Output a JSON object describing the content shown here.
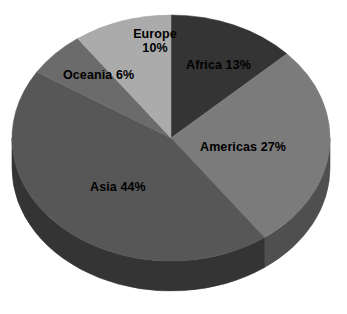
{
  "chart_data": {
    "type": "pie",
    "title": "",
    "subtitle": "",
    "xlabel": "",
    "ylabel": "",
    "grid": false,
    "legend_position": "none",
    "label_style": "inside-slice",
    "start_angle_deg": 0,
    "direction": "clockwise",
    "three_d": true,
    "categories": [
      "Africa",
      "Americas",
      "Asia",
      "Oceania",
      "Europe"
    ],
    "values": [
      13,
      27,
      44,
      6,
      10
    ],
    "unit": "%",
    "slices": [
      {
        "name": "Africa",
        "value": 13,
        "label": "Africa 13%",
        "color": "#343434",
        "side_color": "#1f1f1f"
      },
      {
        "name": "Americas",
        "value": 27,
        "label": "Americas 27%",
        "color": "#7b7b7b",
        "side_color": "#4f4f4f"
      },
      {
        "name": "Asia",
        "value": 44,
        "label": "Asia 44%",
        "color": "#575757",
        "side_color": "#343434"
      },
      {
        "name": "Oceania",
        "value": 6,
        "label": "Oceania 6%",
        "color": "#6b6b6b",
        "side_color": "#3f3f3f"
      },
      {
        "name": "Europe",
        "value": 10,
        "label": "Europe\n10%",
        "label_line1": "Europe",
        "label_line2": "10%",
        "color": "#ababab",
        "side_color": "#6e6e6e"
      }
    ],
    "background_color": "#ffffff",
    "label_color": "#000000"
  }
}
